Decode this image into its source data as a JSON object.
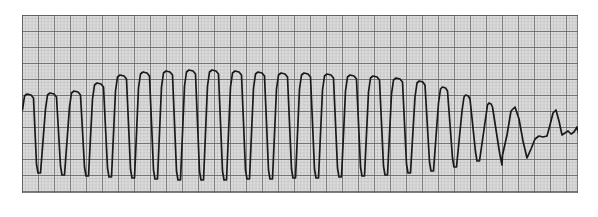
{
  "figure": {
    "title": "ECG Rhythm Strip",
    "caption": "Monomorphic wide-complex tachycardia degenerating to low-amplitude irregular activity"
  },
  "paper": {
    "background_color": "#dcdcdc",
    "minor_line_color": "#b4b4b4",
    "major_line_color": "#5a5a5a",
    "trace_color": "#1a1a1a",
    "minor_spacing_px": 3.2,
    "major_spacing_px": 16,
    "origin_x_px": 22,
    "origin_y_px": 15,
    "width_px": 556,
    "height_px": 178
  },
  "chart_data": {
    "type": "line",
    "title": "ECG Rhythm Strip",
    "xlabel": "",
    "ylabel": "",
    "grid": true,
    "legend": "none",
    "xlim": [
      0,
      556
    ],
    "ylim": [
      178,
      0
    ],
    "series": [
      {
        "name": "ecg-lead",
        "color": "#1a1a1a",
        "baseline_y": 118,
        "complex_count": 22,
        "beats": [
          {
            "index": 1,
            "onset_x": 0,
            "peak_x": 7,
            "peak_y": 79,
            "trough_x": 17,
            "trough_y": 158,
            "peak_width_px": 9
          },
          {
            "index": 2,
            "onset_x": 18,
            "peak_x": 30,
            "peak_y": 78,
            "trough_x": 41,
            "trough_y": 160,
            "peak_width_px": 9
          },
          {
            "index": 3,
            "onset_x": 42,
            "peak_x": 54,
            "peak_y": 76,
            "trough_x": 65,
            "trough_y": 161,
            "peak_width_px": 9
          },
          {
            "index": 4,
            "onset_x": 66,
            "peak_x": 77,
            "peak_y": 68,
            "trough_x": 88,
            "trough_y": 162,
            "peak_width_px": 9
          },
          {
            "index": 5,
            "onset_x": 89,
            "peak_x": 100,
            "peak_y": 60,
            "trough_x": 111,
            "trough_y": 163,
            "peak_width_px": 9
          },
          {
            "index": 6,
            "onset_x": 112,
            "peak_x": 123,
            "peak_y": 57,
            "trough_x": 134,
            "trough_y": 164,
            "peak_width_px": 9
          },
          {
            "index": 7,
            "onset_x": 135,
            "peak_x": 146,
            "peak_y": 56,
            "trough_x": 157,
            "trough_y": 165,
            "peak_width_px": 9
          },
          {
            "index": 8,
            "onset_x": 158,
            "peak_x": 169,
            "peak_y": 55,
            "trough_x": 180,
            "trough_y": 165,
            "peak_width_px": 9
          },
          {
            "index": 9,
            "onset_x": 181,
            "peak_x": 192,
            "peak_y": 55,
            "trough_x": 203,
            "trough_y": 165,
            "peak_width_px": 9
          },
          {
            "index": 10,
            "onset_x": 204,
            "peak_x": 215,
            "peak_y": 56,
            "trough_x": 226,
            "trough_y": 164,
            "peak_width_px": 9
          },
          {
            "index": 11,
            "onset_x": 227,
            "peak_x": 238,
            "peak_y": 57,
            "trough_x": 249,
            "trough_y": 164,
            "peak_width_px": 9
          },
          {
            "index": 12,
            "onset_x": 250,
            "peak_x": 261,
            "peak_y": 58,
            "trough_x": 272,
            "trough_y": 163,
            "peak_width_px": 9
          },
          {
            "index": 13,
            "onset_x": 273,
            "peak_x": 284,
            "peak_y": 58,
            "trough_x": 295,
            "trough_y": 163,
            "peak_width_px": 9
          },
          {
            "index": 14,
            "onset_x": 296,
            "peak_x": 307,
            "peak_y": 59,
            "trough_x": 318,
            "trough_y": 162,
            "peak_width_px": 9
          },
          {
            "index": 15,
            "onset_x": 319,
            "peak_x": 330,
            "peak_y": 60,
            "trough_x": 341,
            "trough_y": 161,
            "peak_width_px": 9
          },
          {
            "index": 16,
            "onset_x": 342,
            "peak_x": 353,
            "peak_y": 61,
            "trough_x": 364,
            "trough_y": 160,
            "peak_width_px": 9
          },
          {
            "index": 17,
            "onset_x": 365,
            "peak_x": 376,
            "peak_y": 63,
            "trough_x": 387,
            "trough_y": 158,
            "peak_width_px": 9
          },
          {
            "index": 18,
            "onset_x": 388,
            "peak_x": 399,
            "peak_y": 66,
            "trough_x": 410,
            "trough_y": 156,
            "peak_width_px": 8
          },
          {
            "index": 19,
            "onset_x": 411,
            "peak_x": 422,
            "peak_y": 72,
            "trough_x": 433,
            "trough_y": 152,
            "peak_width_px": 7
          },
          {
            "index": 20,
            "onset_x": 434,
            "peak_x": 445,
            "peak_y": 80,
            "trough_x": 456,
            "trough_y": 146,
            "peak_width_px": 6
          },
          {
            "index": 21,
            "onset_x": 457,
            "peak_x": 468,
            "peak_y": 88,
            "trough_x": 479,
            "trough_y": 140,
            "peak_width_px": 5
          },
          {
            "index": 22,
            "onset_x": 480,
            "peak_x": 491,
            "peak_y": 94,
            "trough_x": 502,
            "trough_y": 134,
            "peak_width_px": 5
          }
        ],
        "terminal_segment": {
          "description": "low-amplitude irregular undulation with final upstroke",
          "start_x": 480,
          "end_x": 556
        }
      }
    ]
  }
}
